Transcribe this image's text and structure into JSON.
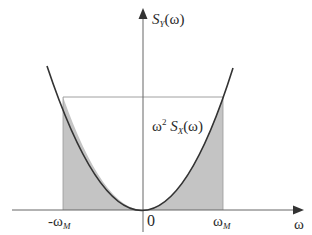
{
  "diagram": {
    "y_axis_label": {
      "prefix": "S",
      "sub": "Y",
      "suffix": "(ω)"
    },
    "curve_label": {
      "omega": "ω",
      "power": "2",
      "S": "S",
      "sub": "X",
      "suffix": "(ω)"
    },
    "x_axis_label": "ω",
    "tick_labels": {
      "neg": {
        "main": "-ω",
        "sub": "M"
      },
      "zero": "0",
      "pos": {
        "main": "ω",
        "sub": "M"
      }
    },
    "colors": {
      "axis": "#555555",
      "curve": "#333333",
      "shade": "#c4c4c4",
      "guide": "#888888"
    }
  }
}
